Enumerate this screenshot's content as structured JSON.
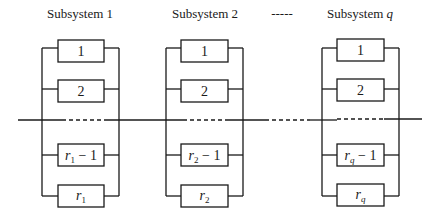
{
  "diagram": {
    "type": "series-parallel reliability block diagram",
    "header": {
      "subsystem1_title": "Subsystem 1",
      "subsystem2_title": "Subsystem 2",
      "subsystem_q_title_prefix": "Subsystem ",
      "subsystem_q_title_var": "q",
      "ellipsis": "-----"
    },
    "subsystems": [
      {
        "name": "Subsystem 1",
        "index": "1",
        "components": [
          {
            "label": "1"
          },
          {
            "label": "2"
          },
          {
            "var": "r",
            "sub": "1",
            "suffix": " − 1"
          },
          {
            "var": "r",
            "sub": "1",
            "suffix": ""
          }
        ]
      },
      {
        "name": "Subsystem 2",
        "index": "2",
        "components": [
          {
            "label": "1"
          },
          {
            "label": "2"
          },
          {
            "var": "r",
            "sub": "2",
            "suffix": " − 1"
          },
          {
            "var": "r",
            "sub": "2",
            "suffix": ""
          }
        ]
      },
      {
        "name": "Subsystem q",
        "index": "q",
        "components": [
          {
            "label": "1"
          },
          {
            "label": "2"
          },
          {
            "var": "r",
            "sub": "q",
            "suffix": " − 1"
          },
          {
            "var": "r",
            "sub": "q",
            "suffix": ""
          }
        ]
      }
    ],
    "colors": {
      "line": "#1a1a1a",
      "background": "#ffffff"
    }
  }
}
